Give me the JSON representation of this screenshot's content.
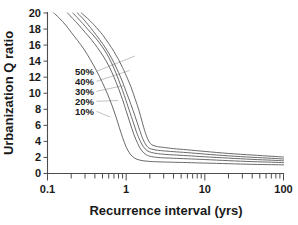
{
  "chart_data": {
    "type": "line",
    "title": "",
    "xlabel": "Recurrence interval (yrs)",
    "ylabel": "Urbanization Q ratio",
    "xscale": "log",
    "yscale": "linear",
    "xlim": [
      0.1,
      100
    ],
    "ylim": [
      0,
      20
    ],
    "x_tick_labels": [
      "0.1",
      "1",
      "10",
      "100"
    ],
    "x_tick_values": [
      0.1,
      1,
      10,
      100
    ],
    "y_tick_labels": [
      "0",
      "2",
      "4",
      "6",
      "8",
      "10",
      "12",
      "14",
      "16",
      "18",
      "20"
    ],
    "y_tick_values": [
      0,
      2,
      4,
      6,
      8,
      10,
      12,
      14,
      16,
      18,
      20
    ],
    "grid": false,
    "legend_position": "inside-left-annotations",
    "series": [
      {
        "name": "50%",
        "label": "50%",
        "knee_x": 1.75,
        "tail_y": 2.05,
        "x": [
          0.27,
          0.3,
          0.35,
          0.4,
          0.5,
          0.6,
          0.7,
          0.8,
          0.9,
          1.0,
          1.15,
          1.3,
          1.45,
          1.6,
          1.75,
          1.9,
          2.05,
          2.2,
          2.5,
          3.0,
          4.0,
          6.0,
          10.0,
          20.0,
          40.0,
          70.0,
          100.0
        ],
        "y": [
          20.0,
          19.6,
          19.0,
          18.4,
          17.3,
          16.2,
          15.2,
          14.2,
          13.2,
          12.2,
          10.8,
          9.3,
          7.9,
          6.4,
          5.1,
          4.2,
          3.7,
          3.5,
          3.35,
          3.25,
          3.1,
          2.95,
          2.75,
          2.5,
          2.3,
          2.15,
          2.05
        ]
      },
      {
        "name": "40%",
        "label": "40%",
        "knee_x": 1.55,
        "tail_y": 1.8,
        "x": [
          0.24,
          0.27,
          0.3,
          0.35,
          0.42,
          0.5,
          0.6,
          0.7,
          0.8,
          0.9,
          1.0,
          1.15,
          1.3,
          1.45,
          1.6,
          1.75,
          1.9,
          2.1,
          2.5,
          3.0,
          4.0,
          6.0,
          10.0,
          20.0,
          40.0,
          70.0,
          100.0
        ],
        "y": [
          20.0,
          19.5,
          19.0,
          18.2,
          17.2,
          16.2,
          15.0,
          13.8,
          12.6,
          11.4,
          10.2,
          8.6,
          7.1,
          5.7,
          4.5,
          3.7,
          3.25,
          3.05,
          2.9,
          2.82,
          2.72,
          2.6,
          2.42,
          2.2,
          2.02,
          1.9,
          1.8
        ]
      },
      {
        "name": "30%",
        "label": "30%",
        "knee_x": 1.35,
        "tail_y": 1.58,
        "x": [
          0.21,
          0.24,
          0.28,
          0.33,
          0.4,
          0.48,
          0.56,
          0.65,
          0.75,
          0.85,
          0.95,
          1.05,
          1.2,
          1.35,
          1.5,
          1.65,
          1.85,
          2.1,
          2.5,
          3.0,
          4.0,
          6.0,
          10.0,
          20.0,
          40.0,
          70.0,
          100.0
        ],
        "y": [
          20.0,
          19.4,
          18.7,
          17.9,
          17.0,
          16.0,
          15.0,
          13.8,
          12.4,
          11.0,
          9.7,
          8.4,
          6.7,
          5.2,
          4.1,
          3.35,
          2.85,
          2.62,
          2.48,
          2.4,
          2.32,
          2.22,
          2.08,
          1.92,
          1.76,
          1.66,
          1.58
        ]
      },
      {
        "name": "20%",
        "label": "20%",
        "knee_x": 1.15,
        "tail_y": 1.35,
        "x": [
          0.18,
          0.21,
          0.25,
          0.3,
          0.36,
          0.43,
          0.52,
          0.61,
          0.7,
          0.8,
          0.9,
          1.0,
          1.12,
          1.25,
          1.4,
          1.55,
          1.75,
          2.0,
          2.5,
          3.0,
          4.0,
          6.0,
          10.0,
          20.0,
          40.0,
          70.0,
          100.0
        ],
        "y": [
          20.0,
          19.3,
          18.5,
          17.6,
          16.7,
          15.7,
          14.5,
          13.3,
          12.0,
          10.6,
          9.2,
          7.8,
          6.3,
          4.9,
          3.75,
          2.95,
          2.42,
          2.15,
          2.0,
          1.95,
          1.9,
          1.83,
          1.74,
          1.6,
          1.48,
          1.41,
          1.35
        ]
      },
      {
        "name": "10%",
        "label": "10%",
        "knee_x": 0.9,
        "tail_y": 1.08,
        "x": [
          0.12,
          0.14,
          0.17,
          0.2,
          0.24,
          0.29,
          0.35,
          0.42,
          0.5,
          0.58,
          0.66,
          0.74,
          0.82,
          0.9,
          1.0,
          1.12,
          1.28,
          1.5,
          1.9,
          2.5,
          4.0,
          6.0,
          10.0,
          20.0,
          40.0,
          70.0,
          100.0
        ],
        "y": [
          20.0,
          19.4,
          18.5,
          17.6,
          16.6,
          15.5,
          14.2,
          12.8,
          11.3,
          9.9,
          8.5,
          7.1,
          5.7,
          4.5,
          3.3,
          2.45,
          1.92,
          1.66,
          1.52,
          1.46,
          1.4,
          1.36,
          1.3,
          1.22,
          1.14,
          1.1,
          1.08
        ]
      }
    ],
    "annotations": [
      {
        "text": "50%",
        "for_series": "50%"
      },
      {
        "text": "40%",
        "for_series": "40%"
      },
      {
        "text": "30%",
        "for_series": "30%"
      },
      {
        "text": "20%",
        "for_series": "20%"
      },
      {
        "text": "10%",
        "for_series": "10%"
      }
    ],
    "colors": {
      "curve": "#595959",
      "axis": "#4d4d4d",
      "text": "#1a1a1a",
      "leader": "#b3b3b3"
    }
  }
}
